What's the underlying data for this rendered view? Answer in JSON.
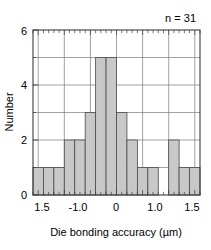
{
  "chart_data": {
    "type": "bar",
    "title": "",
    "subtitle": "",
    "xlabel": "Die bonding accuracy (µm)",
    "ylabel": "Number",
    "xlim": [
      -1.6,
      1.6
    ],
    "ylim": [
      0,
      6
    ],
    "grid": true,
    "legend": null,
    "bin_width": 0.2,
    "annotations": [
      {
        "text": "n = 31",
        "position": "top-right"
      }
    ],
    "xticks": [
      -1.5,
      -1.0,
      0,
      1.0,
      1.5
    ],
    "xticklabels": [
      "1.5",
      "-1.0",
      "0",
      "1.0",
      "1.5"
    ],
    "xticks_major_grid": [
      -1.5,
      -1.0,
      -0.5,
      0,
      0.5,
      1.0,
      1.5
    ],
    "yticks": [
      0,
      2,
      4,
      6
    ],
    "yticklabels": [
      "0",
      "2",
      "4",
      "6"
    ],
    "yticks_minor": [
      1,
      3,
      5
    ],
    "bin_edges": [
      -1.6,
      -1.4,
      -1.2,
      -1.0,
      -0.8,
      -0.6,
      -0.4,
      -0.2,
      0.0,
      0.2,
      0.4,
      0.6,
      0.8,
      1.0,
      1.2,
      1.4,
      1.6
    ],
    "bin_centers": [
      -1.5,
      -1.3,
      -1.1,
      -0.9,
      -0.7,
      -0.5,
      -0.3,
      -0.1,
      0.1,
      0.3,
      0.5,
      0.7,
      0.9,
      1.1,
      1.3,
      1.5
    ],
    "categories": [
      "-1.5",
      "-1.3",
      "-1.1",
      "-0.9",
      "-0.7",
      "-0.5",
      "-0.3",
      "-0.1",
      "0.1",
      "0.3",
      "0.5",
      "0.7",
      "0.9",
      "1.1",
      "1.3",
      "1.5"
    ],
    "values": [
      1,
      1,
      1,
      2,
      2,
      3,
      5,
      5,
      3,
      2,
      1,
      1,
      0,
      2,
      1,
      1
    ],
    "total_count": 31,
    "colors": {
      "bar_fill": "#c8c8c8",
      "bar_edge": "#4a4a4a",
      "axis": "#3c3c3c",
      "grid": "#7a7a7a",
      "text": "#000000",
      "background": "#ffffff"
    }
  },
  "labels": {
    "xlabel": "Die bonding accuracy (µm)",
    "ylabel": "Number",
    "annotation": "n = 31",
    "xtick_0": "1.5",
    "xtick_1": "-1.0",
    "xtick_2": "0",
    "xtick_3": "1.0",
    "xtick_4": "1.5",
    "ytick_0": "0",
    "ytick_1": "2",
    "ytick_2": "4",
    "ytick_3": "6"
  }
}
